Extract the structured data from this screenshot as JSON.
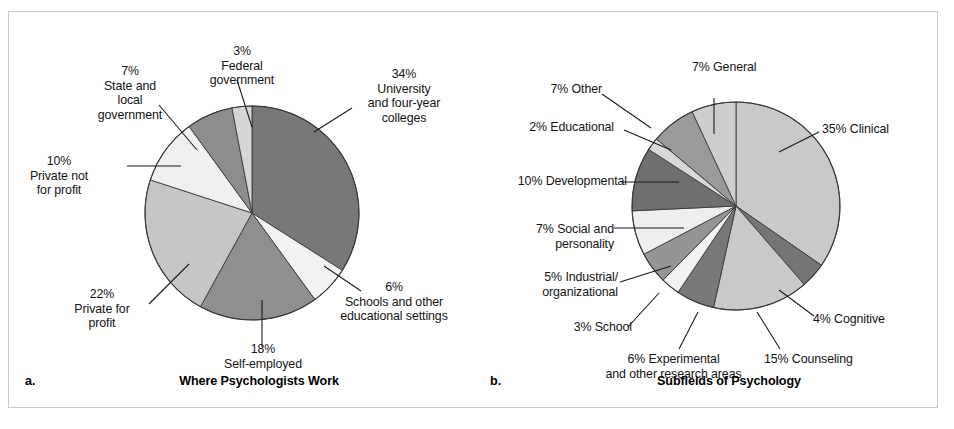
{
  "figure": {
    "background": "#ffffff",
    "frame_color": "#c9c9c9"
  },
  "chart_data": [
    {
      "type": "pie",
      "id": "where-psychologists-work",
      "panel_letter": "a.",
      "title": "Where Psychologists Work",
      "start_angle_deg": 0,
      "direction": "clockwise",
      "center": [
        243,
        201
      ],
      "radius": 107,
      "categories": [
        "University and four-year colleges",
        "Schools and other educational settings",
        "Self-employed",
        "Private for profit",
        "Private not for profit",
        "State and local government",
        "Federal government"
      ],
      "values": [
        34,
        6,
        18,
        22,
        10,
        7,
        3
      ],
      "labels": [
        "34%\nUniversity\nand four-year\ncolleges",
        "6%\nSchools and other\neducational settings",
        "18%\nSelf-employed",
        "22%\nPrivate for\nprofit",
        "10%\nPrivate not\nfor profit",
        "7%\nState and\nlocal\ngovernment",
        "3%\nFederal\ngovernment"
      ],
      "colors": [
        "#787878",
        "#f2f2f2",
        "#8f8f8f",
        "#c6c6c6",
        "#f0f0f0",
        "#8d8d8d",
        "#d6d6d6"
      ],
      "xlabel": "",
      "ylabel": ""
    },
    {
      "type": "pie",
      "id": "subfields-of-psychology",
      "panel_letter": "b.",
      "title": "Subfields of Psychology",
      "start_angle_deg": 0,
      "direction": "clockwise",
      "center": [
        262,
        194
      ],
      "radius": 104,
      "categories": [
        "Clinical",
        "Cognitive",
        "Counseling",
        "Experimental and other research areas",
        "School",
        "Industrial/organizational",
        "Social and personality",
        "Developmental",
        "Educational",
        "Other",
        "General"
      ],
      "values": [
        35,
        4,
        15,
        6,
        3,
        5,
        7,
        10,
        2,
        7,
        7
      ],
      "labels": [
        "35% Clinical",
        "4% Cognitive",
        "15% Counseling",
        "6% Experimental\nand other research areas",
        "3% School",
        "5% Industrial/\norganizational",
        "7% Social and\npersonality",
        "10% Developmental",
        "2% Educational",
        "7% Other",
        "7% General"
      ],
      "colors": [
        "#c9c9c9",
        "#757575",
        "#c9c9c9",
        "#787878",
        "#f2f2f2",
        "#959595",
        "#eeeeee",
        "#6f6f6f",
        "#d8d8d8",
        "#9a9a9a",
        "#cdcdcd"
      ],
      "xlabel": "",
      "ylabel": ""
    }
  ],
  "panel_a": {
    "letter": "a.",
    "caption": "Where Psychologists Work",
    "labels": {
      "federal_government": "3%\nFederal\ngovernment",
      "state_and_local_government": "7%\nState and\nlocal\ngovernment",
      "private_not_for_profit": "10%\nPrivate not\nfor profit",
      "private_for_profit": "22%\nPrivate for\nprofit",
      "self_employed": "18%\nSelf-employed",
      "schools_and_other_educational_settings": "6%\nSchools and other\neducational settings",
      "university_and_four_year_colleges": "34%\nUniversity\nand four-year\ncolleges"
    }
  },
  "panel_b": {
    "letter": "b.",
    "caption": "Subfields of Psychology",
    "labels": {
      "general": "7% General",
      "clinical": "35% Clinical",
      "cognitive": "4% Cognitive",
      "counseling": "15% Counseling",
      "experimental": "6% Experimental\nand other research areas",
      "school": "3% School",
      "industrial_organizational": "5% Industrial/\norganizational",
      "social_and_personality": "7% Social and\npersonality",
      "developmental": "10% Developmental",
      "educational": "2% Educational",
      "other": "7% Other"
    }
  }
}
